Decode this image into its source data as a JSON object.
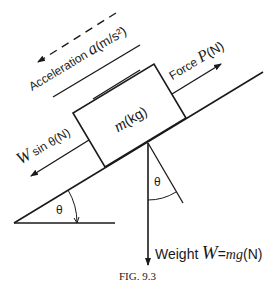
{
  "figure": {
    "caption": "FIG. 9.3",
    "angle_symbol": "θ",
    "mass_label": {
      "symbol": "m",
      "unit": "(kg)"
    },
    "acceleration_label": {
      "text": "Acceleration",
      "symbol": "a",
      "unit": "(m/s²)"
    },
    "force_label": {
      "text": "Force",
      "symbol": "P",
      "unit": "(N)"
    },
    "component_label": {
      "symbol": "W",
      "text": "sin θ",
      "unit": "(N)"
    },
    "weight_label": {
      "text": "Weight",
      "symbol": "W",
      "eq": "=",
      "expr": "mg",
      "unit": "(N)"
    }
  },
  "colors": {
    "ink": "#1a1a1a",
    "background": "#ffffff"
  }
}
